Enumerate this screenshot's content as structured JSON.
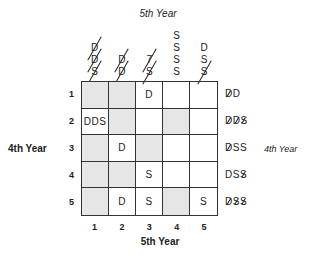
{
  "titles": {
    "top": "5th Year",
    "bottom": "5th Year",
    "left": "4th Year",
    "right": "4th Year"
  },
  "column_headers": [
    {
      "column": 1,
      "symbols": [
        {
          "t": "D",
          "struck": true
        },
        {
          "t": "D",
          "struck": true
        },
        {
          "t": "S",
          "struck": true
        }
      ]
    },
    {
      "column": 2,
      "symbols": [
        {
          "t": "D",
          "struck": true
        },
        {
          "t": "D",
          "struck": true
        }
      ]
    },
    {
      "column": 3,
      "symbols": [
        {
          "t": "7",
          "struck": true
        },
        {
          "t": "S",
          "struck": true
        }
      ]
    },
    {
      "column": 4,
      "symbols": [
        {
          "t": "S",
          "struck": false
        },
        {
          "t": "S",
          "struck": false
        },
        {
          "t": "S",
          "struck": false
        },
        {
          "t": "S",
          "struck": false
        }
      ]
    },
    {
      "column": 5,
      "symbols": [
        {
          "t": "D",
          "struck": false
        },
        {
          "t": "S",
          "struck": false
        },
        {
          "t": "S",
          "struck": true
        }
      ]
    }
  ],
  "row_labels": [
    "1",
    "2",
    "3",
    "4",
    "5"
  ],
  "col_labels": [
    "1",
    "2",
    "3",
    "4",
    "5"
  ],
  "grid": [
    [
      {
        "text": "",
        "shaded": true
      },
      {
        "text": "",
        "shaded": true
      },
      {
        "text": "D",
        "shaded": false
      },
      {
        "text": "",
        "shaded": false
      },
      {
        "text": "",
        "shaded": false
      }
    ],
    [
      {
        "text": "DDS",
        "shaded": false
      },
      {
        "text": "",
        "shaded": true
      },
      {
        "text": "",
        "shaded": false
      },
      {
        "text": "",
        "shaded": true
      },
      {
        "text": "",
        "shaded": false
      }
    ],
    [
      {
        "text": "",
        "shaded": true
      },
      {
        "text": "D",
        "shaded": false
      },
      {
        "text": "",
        "shaded": true
      },
      {
        "text": "",
        "shaded": false
      },
      {
        "text": "",
        "shaded": false
      }
    ],
    [
      {
        "text": "",
        "shaded": true
      },
      {
        "text": "",
        "shaded": true
      },
      {
        "text": "S",
        "shaded": false
      },
      {
        "text": "",
        "shaded": false
      },
      {
        "text": "",
        "shaded": false
      }
    ],
    [
      {
        "text": "",
        "shaded": true
      },
      {
        "text": "D",
        "shaded": false
      },
      {
        "text": "S",
        "shaded": false
      },
      {
        "text": "",
        "shaded": true
      },
      {
        "text": "S",
        "shaded": false
      }
    ]
  ],
  "row_headers_right": [
    [
      {
        "t": "D",
        "struck": true
      },
      {
        "t": "D",
        "struck": false
      }
    ],
    [
      {
        "t": "D",
        "struck": true
      },
      {
        "t": "D",
        "struck": true
      },
      {
        "t": "S",
        "struck": true
      }
    ],
    [
      {
        "t": "D",
        "struck": true
      },
      {
        "t": "S",
        "struck": false
      },
      {
        "t": "S",
        "struck": false
      }
    ],
    [
      {
        "t": "D",
        "struck": false
      },
      {
        "t": "S",
        "struck": false
      },
      {
        "t": "S",
        "struck": true
      }
    ],
    [
      {
        "t": "D",
        "struck": true
      },
      {
        "t": "S",
        "struck": true
      },
      {
        "t": "S",
        "struck": true
      }
    ]
  ]
}
